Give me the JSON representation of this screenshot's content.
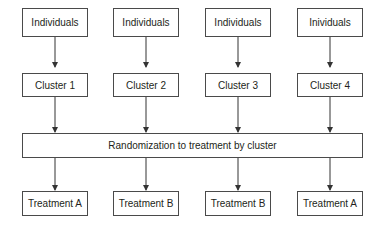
{
  "diagram": {
    "type": "flowchart",
    "title": "",
    "individuals": [
      "Individuals",
      "Individuals",
      "Individuals",
      "Inividuals"
    ],
    "clusters": [
      "Cluster 1",
      "Cluster 2",
      "Cluster 3",
      "Cluster 4"
    ],
    "randomization": "Randomization to treatment by cluster",
    "treatments": [
      "Treatment A",
      "Treatment B",
      "Treatment B",
      "Treatment A"
    ],
    "edges": [
      {
        "from": "individuals.0",
        "to": "clusters.0"
      },
      {
        "from": "individuals.1",
        "to": "clusters.1"
      },
      {
        "from": "individuals.2",
        "to": "clusters.2"
      },
      {
        "from": "individuals.3",
        "to": "clusters.3"
      },
      {
        "from": "clusters.0",
        "to": "randomization"
      },
      {
        "from": "clusters.1",
        "to": "randomization"
      },
      {
        "from": "clusters.2",
        "to": "randomization"
      },
      {
        "from": "clusters.3",
        "to": "randomization"
      },
      {
        "from": "randomization",
        "to": "treatments.0"
      },
      {
        "from": "randomization",
        "to": "treatments.1"
      },
      {
        "from": "randomization",
        "to": "treatments.2"
      },
      {
        "from": "randomization",
        "to": "treatments.3"
      }
    ],
    "colors": {
      "stroke": "#4a4a4a",
      "text": "#231f20",
      "background": "#ffffff"
    }
  }
}
